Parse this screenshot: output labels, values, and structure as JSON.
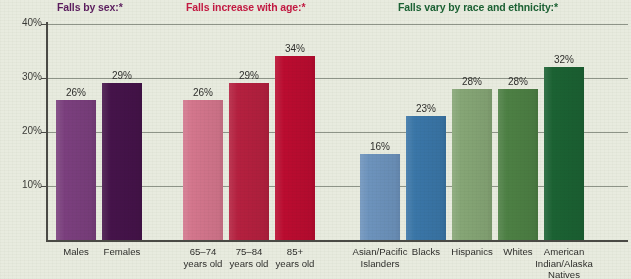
{
  "chart_data": {
    "type": "bar",
    "title": "",
    "xlabel": "",
    "ylabel": "",
    "ylim": [
      0,
      40
    ],
    "ytick_labels": [
      "10%",
      "20%",
      "30%",
      "40%"
    ],
    "ytick_values": [
      10,
      20,
      30,
      40
    ],
    "grid": true,
    "legend": "none",
    "groups": [
      {
        "id": "sex",
        "title": "Falls by sex:*",
        "title_color": "#5b1d5e",
        "categories": [
          "Males",
          "Females"
        ],
        "values": [
          26,
          29
        ],
        "value_labels": [
          "26%",
          "29%"
        ],
        "colors": [
          "#7b3f7e",
          "#45134a"
        ]
      },
      {
        "id": "age",
        "title": "Falls increase with age:*",
        "title_color": "#c41a42",
        "categories": [
          "65–74\nyears old",
          "75–84\nyears old",
          "85+\nyears old"
        ],
        "values": [
          26,
          29,
          34
        ],
        "value_labels": [
          "26%",
          "29%",
          "34%"
        ],
        "colors": [
          "#d4768d",
          "#b5203f",
          "#bb0c30"
        ]
      },
      {
        "id": "race",
        "title": "Falls vary by race and ethnicity:*",
        "title_color": "#1c6234",
        "categories": [
          "Asian/Pacific\nIslanders",
          "Blacks",
          "Hispanics",
          "Whites",
          "American\nIndian/Alaska\nNatives"
        ],
        "values": [
          16,
          23,
          28,
          28,
          32
        ],
        "value_labels": [
          "16%",
          "23%",
          "28%",
          "28%",
          "32%"
        ],
        "colors": [
          "#6d93bd",
          "#3a76a8",
          "#86a676",
          "#4d8044",
          "#1b6233"
        ]
      }
    ]
  },
  "colors": {
    "background": "#e8ebdf",
    "axis": "#4a4a45",
    "gridline": "#8e9488",
    "text": "#2f2f2c"
  }
}
